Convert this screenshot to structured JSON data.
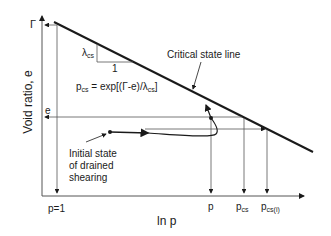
{
  "diagram": {
    "y_axis_label": "Void ratio, e",
    "x_axis_label": "ln p",
    "gamma_label": "Γ",
    "e_label": "e",
    "csl_label": "Critical state line",
    "slope": {
      "lambda": "λ",
      "lambda_sub": "cs",
      "run": "1"
    },
    "equation": {
      "lhs": "p",
      "lhs_sub": "cs",
      "rhs": " = exp[(Γ-e)/λ",
      "rhs_sub": "cs",
      "close": "]"
    },
    "initial_state_label": [
      "Initial state",
      "of drained",
      "shearing"
    ],
    "x_ticks": {
      "p1": "p=1",
      "p": "p",
      "pcs": "p",
      "pcs_sub": "cs",
      "pcsi": "p",
      "pcsi_sub": "cs(i)"
    },
    "colors": {
      "line": "#1a1a1a",
      "thin": "#555555"
    }
  }
}
